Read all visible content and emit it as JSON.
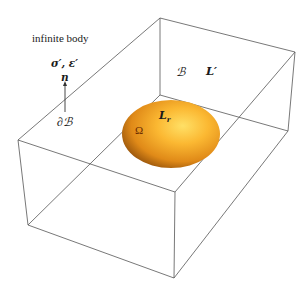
{
  "diagram": {
    "type": "3d-box-with-inclusion",
    "labels": {
      "infinite_body": "infinite body",
      "far_field": "σ′, ε′",
      "normal": "n",
      "boundary": "∂ℬ",
      "body": "ℬ",
      "body_stiffness": "L′",
      "inclusion_stiffness": "Lr",
      "inclusion_stiffness_base": "L",
      "inclusion_stiffness_sub": "r",
      "inclusion_domain": "Ω"
    },
    "colors": {
      "box_edges": "#555555",
      "inclusion_light": "#ffd24a",
      "inclusion_mid": "#f0a020",
      "inclusion_dark": "#8a4a08",
      "text": "#1a1a1a"
    }
  }
}
